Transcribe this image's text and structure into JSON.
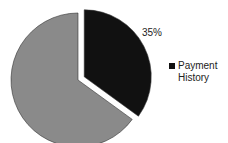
{
  "chart_data": {
    "type": "pie",
    "title": "",
    "slices": [
      {
        "name": "Payment History",
        "value": 35,
        "color": "#111111",
        "label": "35%",
        "exploded": true
      },
      {
        "name": "",
        "value": 65,
        "color": "#8a8a8a",
        "label": "",
        "exploded": false
      }
    ],
    "start_angle": "12 o'clock",
    "direction": "clockwise",
    "legend": {
      "placement": "right",
      "entries": [
        {
          "name": "Payment History",
          "color": "#111111"
        }
      ]
    }
  }
}
